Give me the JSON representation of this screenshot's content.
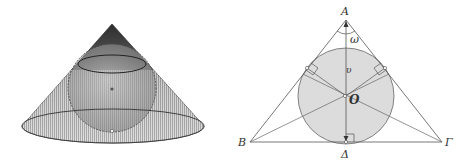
{
  "left_figure": {
    "description": "Cone with inscribed sphere (3D view)",
    "center_marker": "o"
  },
  "right_figure": {
    "description": "Cross-section: isosceles triangle with inscribed circle",
    "labels": {
      "apex": "A",
      "left_vertex": "B",
      "right_vertex": "Γ",
      "base_foot": "Δ",
      "center": "O",
      "angle": "ω",
      "height": "υ"
    }
  },
  "colors": {
    "line": "#555555",
    "circle_fill": "#dcdcdc",
    "cone_dark": "#3a3a3a",
    "cone_light": "#bfbfbf"
  }
}
